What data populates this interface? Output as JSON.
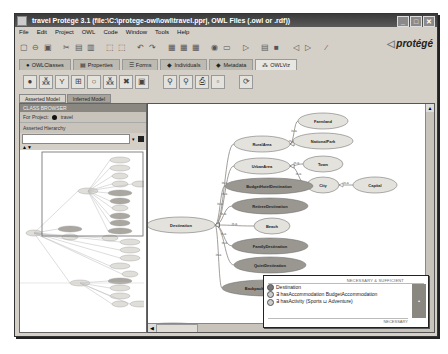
{
  "window": {
    "title": "travel  Protégé 3.1    (file:\\C:\\protege-owl\\owl\\travel.pprj, OWL Files (.owl or .rdf))",
    "controls": [
      "minimize",
      "maximize",
      "close"
    ]
  },
  "menu": [
    "File",
    "Edit",
    "Project",
    "OWL",
    "Code",
    "Window",
    "Tools",
    "Help"
  ],
  "toolbar": {
    "icons": [
      "new-icon",
      "open-icon",
      "save-icon",
      "cut-icon",
      "copy-icon",
      "paste-icon",
      "import-icon",
      "export-icon",
      "undo-icon",
      "redo-icon",
      "class-icon",
      "property-icon",
      "individual-icon",
      "reasoner-icon",
      "check-icon",
      "run-icon",
      "form-icon",
      "grid-icon",
      "back-icon",
      "forward-icon",
      "wand-icon"
    ],
    "glyphs": [
      "▢",
      "⊖",
      "▣",
      "✂",
      "▤",
      "▥",
      "⬚",
      "⬚",
      "↶",
      "↷",
      "▦",
      "▦",
      "▦",
      "◉",
      "▭",
      "▷",
      "▤",
      "■",
      "◁",
      "▷",
      "⁄"
    ],
    "logo": "protégé"
  },
  "tabs": [
    {
      "label": "OWLClasses",
      "icon": "●"
    },
    {
      "label": "Properties",
      "icon": "▤"
    },
    {
      "label": "Forms",
      "icon": "☰"
    },
    {
      "label": "Individuals",
      "icon": "◆"
    },
    {
      "label": "Metadata",
      "icon": "◆"
    },
    {
      "label": "OWLViz",
      "icon": "⁂",
      "active": true
    }
  ],
  "viz_toolbar": {
    "glyphs": [
      "●",
      "⁂",
      "Y",
      "⊞",
      "○",
      "⁂",
      "✖",
      "▣",
      "",
      "⚲",
      "⚲",
      "⎙",
      "▫",
      "",
      "⟳"
    ]
  },
  "subtabs": [
    {
      "label": "Asserted Model",
      "active": true
    },
    {
      "label": "Inferred Model"
    }
  ],
  "left_panel": {
    "header": "CLASS BROWSER",
    "project_label": "For Project:",
    "project_name": "travel",
    "hierarchy_label": "Asserted Hierarchy",
    "arrows": "▲▼"
  },
  "graph": {
    "edge_label": "is-a",
    "nodes": [
      {
        "id": "Destination",
        "type": "plain"
      },
      {
        "id": "RuralArea",
        "type": "plain"
      },
      {
        "id": "UrbanArea",
        "type": "plain"
      },
      {
        "id": "Farmland",
        "type": "plain"
      },
      {
        "id": "NationalPark",
        "type": "plain"
      },
      {
        "id": "Town",
        "type": "plain"
      },
      {
        "id": "City",
        "type": "plain"
      },
      {
        "id": "Capital",
        "type": "plain"
      },
      {
        "id": "BudgetHotelDestination",
        "type": "defined"
      },
      {
        "id": "RetireeDestination",
        "type": "defined"
      },
      {
        "id": "Beach",
        "type": "plain"
      },
      {
        "id": "FamilyDestination",
        "type": "defined"
      },
      {
        "id": "QuietDestination",
        "type": "defined"
      },
      {
        "id": "BackpackersDestination",
        "type": "defined"
      },
      {
        "id": "AccommodationRating",
        "type": "defined"
      },
      {
        "id": "Contact",
        "type": "plain"
      },
      {
        "id": "Surfing",
        "type": "plain"
      },
      {
        "id": "Sports",
        "type": "plain"
      },
      {
        "id": "Sightseeing",
        "type": "plain"
      }
    ]
  },
  "tooltip": {
    "header": "NECESSARY & SUFFICIENT",
    "rows": [
      "Destination",
      "∃ hasAccommodation BudgetAccommodation",
      "∃ hasActivity (Sports ⊔ Adventure)"
    ],
    "footer": "NECESSARY",
    "side_glyph": "•"
  },
  "colors": {
    "plain_node": "#e4e2dc",
    "defined_node": "#9a9690",
    "edge": "#8a8780"
  }
}
